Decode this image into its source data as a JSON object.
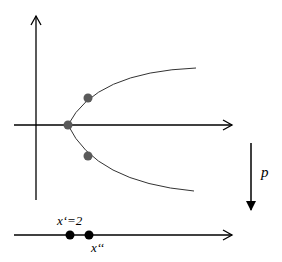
{
  "diagram": {
    "upper_plot": {
      "axes": {
        "x_axis": "horizontal arrow",
        "y_axis": "vertical arrow"
      },
      "curve": "sideways parabola opening right",
      "points": [
        {
          "name": "vertex",
          "color": "#5a5a5a"
        },
        {
          "name": "upper-branch-point",
          "color": "#5a5a5a"
        },
        {
          "name": "lower-branch-point",
          "color": "#5a5a5a"
        }
      ]
    },
    "projection_arrow": {
      "label": "p"
    },
    "lower_line": {
      "points": [
        {
          "name": "x-prime",
          "label": "x‘=2",
          "color": "#000000"
        },
        {
          "name": "x-double-prime",
          "label": "x‘‘",
          "color": "#000000"
        }
      ]
    }
  }
}
